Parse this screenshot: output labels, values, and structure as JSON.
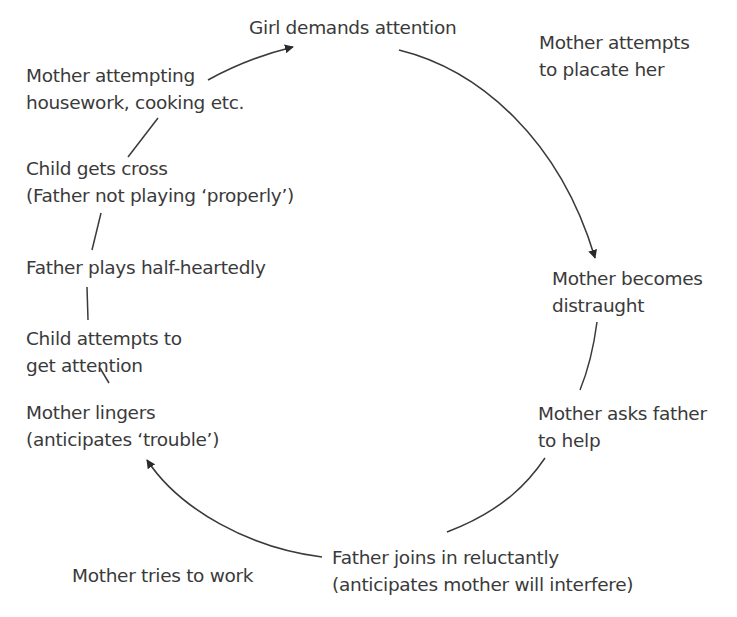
{
  "diagram": {
    "type": "cycle",
    "colors": {
      "text": "#3a3a3a",
      "line": "#3a3a3a",
      "background": "#ffffff"
    },
    "nodes": [
      {
        "id": "girl-demands",
        "lines": [
          "Girl demands attention"
        ]
      },
      {
        "id": "mother-placate",
        "lines": [
          "Mother attempts",
          "to placate her"
        ]
      },
      {
        "id": "mother-distraught",
        "lines": [
          "Mother becomes",
          "distraught"
        ]
      },
      {
        "id": "mother-asks-father",
        "lines": [
          "Mother asks father",
          "to help"
        ]
      },
      {
        "id": "father-joins",
        "lines": [
          "Father joins in reluctantly",
          "(anticipates mother will interfere)"
        ]
      },
      {
        "id": "mother-tries-work",
        "lines": [
          "Mother tries to work"
        ]
      },
      {
        "id": "mother-lingers",
        "lines": [
          "Mother lingers",
          "(anticipates ‘trouble’)"
        ]
      },
      {
        "id": "child-attempts",
        "lines": [
          "Child attempts to",
          "get attention"
        ]
      },
      {
        "id": "father-plays",
        "lines": [
          "Father plays half-heartedly"
        ]
      },
      {
        "id": "child-cross",
        "lines": [
          "Child gets cross",
          "(Father not playing ‘properly’)"
        ]
      },
      {
        "id": "mother-housework",
        "lines": [
          "Mother attempting",
          "housework, cooking etc."
        ]
      }
    ],
    "edges": [
      {
        "from": "girl-demands",
        "to": "mother-distraught",
        "arrow": true
      },
      {
        "from": "mother-distraught",
        "to": "mother-asks-father",
        "arrow": false
      },
      {
        "from": "mother-asks-father",
        "to": "father-joins",
        "arrow": false
      },
      {
        "from": "father-joins",
        "to": "mother-lingers",
        "arrow": true
      },
      {
        "from": "mother-lingers",
        "to": "child-attempts",
        "arrow": false
      },
      {
        "from": "child-attempts",
        "to": "father-plays",
        "arrow": false
      },
      {
        "from": "father-plays",
        "to": "child-cross",
        "arrow": false
      },
      {
        "from": "child-cross",
        "to": "mother-housework",
        "arrow": false
      },
      {
        "from": "mother-housework",
        "to": "girl-demands",
        "arrow": true
      }
    ]
  }
}
